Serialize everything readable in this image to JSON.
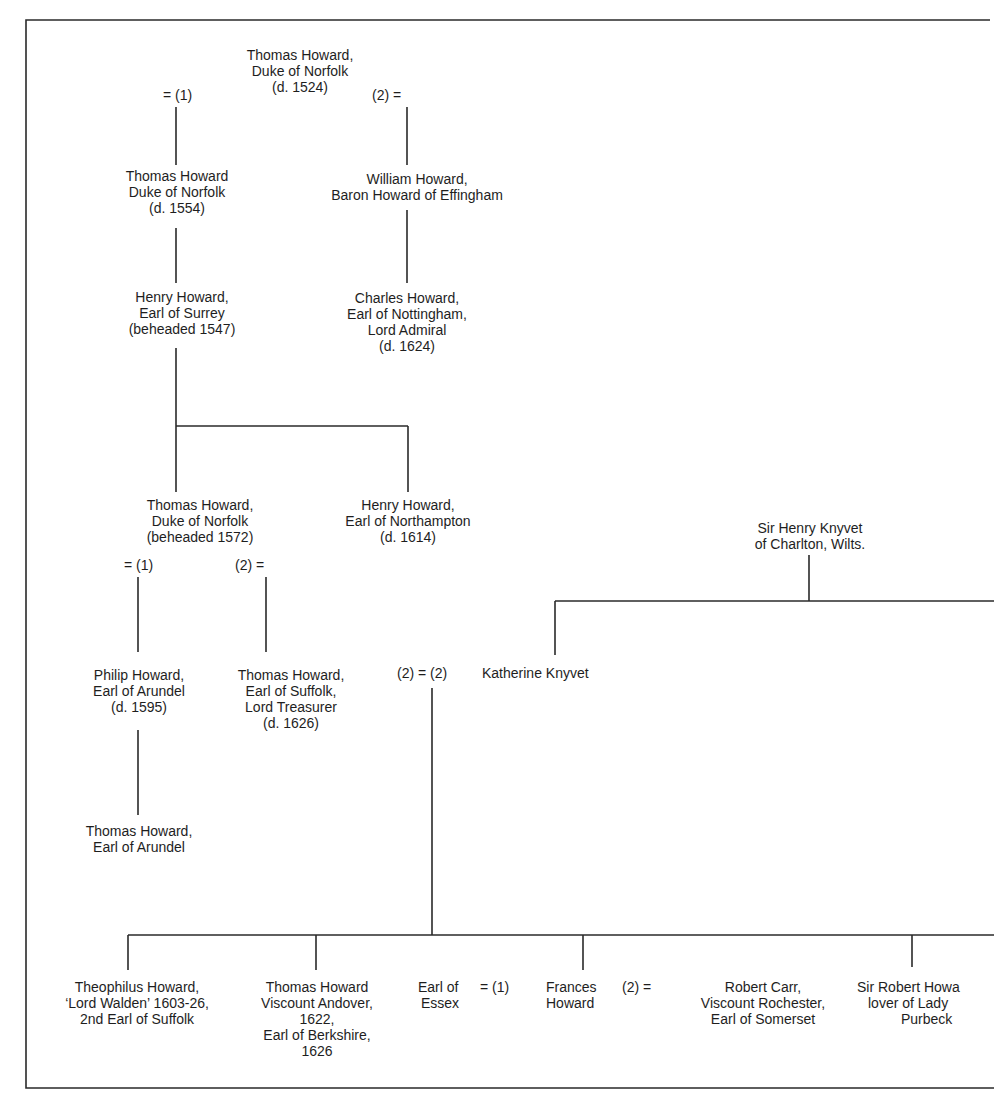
{
  "diagram": {
    "type": "family-tree",
    "colors": {
      "line": "#2a2a2a",
      "text": "#1e1e1e",
      "background": "#ffffff"
    },
    "nodes": {
      "thomas_1524": {
        "lines": [
          "Thomas Howard,",
          "Duke of Norfolk",
          "(d. 1524)"
        ]
      },
      "thomas_1554": {
        "lines": [
          "Thomas Howard",
          "Duke of Norfolk",
          "(d. 1554)"
        ]
      },
      "william_effingham": {
        "lines": [
          "William Howard,",
          "Baron Howard of Effingham"
        ]
      },
      "henry_surrey": {
        "lines": [
          "Henry Howard,",
          "Earl of Surrey",
          "(beheaded 1547)"
        ]
      },
      "charles_nottingham": {
        "lines": [
          "Charles Howard,",
          "Earl of Nottingham,",
          "Lord Admiral",
          "(d. 1624)"
        ]
      },
      "thomas_1572": {
        "lines": [
          "Thomas Howard,",
          "Duke of Norfolk",
          "(beheaded 1572)"
        ]
      },
      "henry_northampton": {
        "lines": [
          "Henry Howard,",
          "Earl of Northampton",
          "(d. 1614)"
        ]
      },
      "henry_knyvet": {
        "lines": [
          "Sir Henry Knyvet",
          "of Charlton, Wilts."
        ]
      },
      "philip_arundel": {
        "lines": [
          "Philip Howard,",
          "Earl of Arundel",
          "(d. 1595)"
        ]
      },
      "thomas_suffolk": {
        "lines": [
          "Thomas Howard,",
          "Earl of Suffolk,",
          "Lord Treasurer",
          "(d. 1626)"
        ]
      },
      "katherine_knyvet": {
        "lines": [
          "Katherine Knyvet"
        ]
      },
      "thomas_arundel": {
        "lines": [
          "Thomas Howard,",
          "Earl of Arundel"
        ]
      },
      "theophilus": {
        "lines": [
          "Theophilus Howard,",
          "‘Lord Walden’ 1603-26,",
          "2nd Earl of Suffolk"
        ]
      },
      "thomas_andover": {
        "lines": [
          "Thomas Howard",
          "Viscount Andover,",
          "1622,",
          "Earl of Berkshire,",
          "1626"
        ]
      },
      "earl_essex": {
        "lines": [
          "Earl of",
          "Essex"
        ]
      },
      "frances": {
        "lines": [
          "Frances",
          "Howard"
        ]
      },
      "robert_carr": {
        "lines": [
          "Robert Carr,",
          "Viscount Rochester,",
          "Earl of Somerset"
        ]
      },
      "robert_howard": {
        "lines": [
          "Sir Robert Howa",
          "lover of Lady",
          "Purbeck"
        ]
      }
    },
    "marriage_marks": {
      "root_m1": "= (1)",
      "root_m2": "(2) =",
      "norfolk1572_m1": "= (1)",
      "norfolk1572_m2": "(2) =",
      "suffolk_knyvet": "(2) = (2)",
      "essex_frances": "= (1)",
      "frances_carr": "(2) ="
    }
  }
}
